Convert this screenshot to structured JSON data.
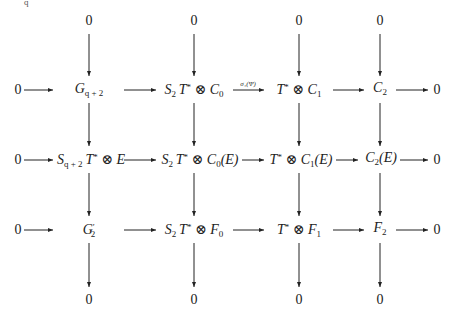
{
  "diagram": {
    "top_row": [
      "0",
      "0",
      "0",
      "0"
    ],
    "bottom_row": [
      "0",
      "0",
      "0",
      "0"
    ],
    "rows": [
      {
        "left": "0",
        "nodes": [
          {
            "base": "G",
            "sub": "q+2"
          },
          {
            "pre": "S",
            "pre_sub": "2",
            "mid": "T",
            "mid_sup": "*",
            "op": " ⊗ ",
            "base": "C",
            "sub": "0"
          },
          {
            "mid": "T",
            "mid_sup": "*",
            "op": " ⊗ ",
            "base": "C",
            "sub": "1"
          },
          {
            "base": "C",
            "sub": "2"
          }
        ],
        "right": "0",
        "arrow_labels": {
          "2": "σ₁(Ψ)"
        }
      },
      {
        "left": "0",
        "nodes": [
          {
            "pre": "S",
            "pre_sub": "q+2",
            "mid": "T",
            "mid_sup": "*",
            "op": " ⊗ ",
            "base": "E"
          },
          {
            "pre": "S",
            "pre_sub": "2",
            "mid": "T",
            "mid_sup": "*",
            "op": " ⊗ ",
            "base": "C",
            "sub": "0",
            "arg": "(E)"
          },
          {
            "mid": "T",
            "mid_sup": "*",
            "op": " ⊗ ",
            "base": "C",
            "sub": "1",
            "arg": "(E)"
          },
          {
            "base": "C",
            "sub": "2",
            "arg": "(E)"
          }
        ],
        "right": "0"
      },
      {
        "left": "0",
        "nodes": [
          {
            "base": "G",
            "prime": "′",
            "sub": "2"
          },
          {
            "pre": "S",
            "pre_sub": "2",
            "mid": "T",
            "mid_sup": "*",
            "op": " ⊗ ",
            "base": "F",
            "sub": "0"
          },
          {
            "mid": "T",
            "mid_sup": "*",
            "op": " ⊗ ",
            "base": "F",
            "sub": "1"
          },
          {
            "base": "F",
            "sub": "2"
          }
        ],
        "right": "0"
      }
    ],
    "labels": {
      "r1n1_base": "G",
      "r1n1_sub": "q + 2",
      "r1n2_a": "S",
      "r1n2_a_sub": "2",
      "r1n2_b": "T",
      "r1n2_b_sup": "*",
      "r1n2_op": " ⊗ ",
      "r1n2_c": "C",
      "r1n2_c_sub": "0",
      "r1n3_b": "T",
      "r1n3_b_sup": "*",
      "r1n3_op": " ⊗ ",
      "r1n3_c": "C",
      "r1n3_c_sub": "1",
      "r1n4_c": "C",
      "r1n4_c_sub": "2",
      "r2n1_a": "S",
      "r2n1_a_sub": "q + 2",
      "r2n1_b": "T",
      "r2n1_b_sup": "*",
      "r2n1_op": " ⊗ ",
      "r2n1_c": "E",
      "r2n2_a": "S",
      "r2n2_a_sub": "2",
      "r2n2_b": "T",
      "r2n2_b_sup": "*",
      "r2n2_op": " ⊗ ",
      "r2n2_c": "C",
      "r2n2_c_sub": "0",
      "r2n2_arg": "(E)",
      "r2n3_b": "T",
      "r2n3_b_sup": "*",
      "r2n3_op": " ⊗ ",
      "r2n3_c": "C",
      "r2n3_c_sub": "1",
      "r2n3_arg": "(E)",
      "r2n4_c": "C",
      "r2n4_c_sub": "2",
      "r2n4_arg": "(E)",
      "r3n1_base": "G",
      "r3n1_prime": "′",
      "r3n1_sub": "2",
      "r3n2_a": "S",
      "r3n2_a_sub": "2",
      "r3n2_b": "T",
      "r3n2_b_sup": "*",
      "r3n2_op": " ⊗ ",
      "r3n2_c": "F",
      "r3n2_c_sub": "0",
      "r3n3_b": "T",
      "r3n3_b_sup": "*",
      "r3n3_op": " ⊗ ",
      "r3n3_c": "F",
      "r3n3_c_sub": "1",
      "r3n4_c": "F",
      "r3n4_c_sub": "2",
      "zero": "0",
      "sigma_label": "σ₁(Ψ)"
    },
    "top_fragment": "q"
  }
}
